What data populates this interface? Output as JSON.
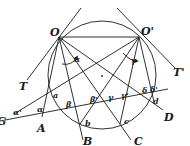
{
  "figure": {
    "colors": {
      "ink": "#1a1a1a",
      "background": "#ffffff"
    },
    "points": {
      "O": {
        "label": "O",
        "x": 59,
        "y": 37
      },
      "O_prime": {
        "label": "O'",
        "x": 139,
        "y": 37
      },
      "a": {
        "label": "a",
        "x": 50,
        "y": 94
      },
      "b": {
        "label": "b",
        "x": 80,
        "y": 124
      },
      "c": {
        "label": "c",
        "x": 120,
        "y": 124
      },
      "d": {
        "label": "d",
        "x": 154,
        "y": 102
      }
    },
    "circle": {
      "cx": 102,
      "cy": 75,
      "r": 54
    },
    "labels": {
      "T": "T",
      "T_prime": "T'",
      "A": "A",
      "B": "B",
      "C": "C",
      "D": "D",
      "G": "G",
      "a": "a",
      "b": "b",
      "c": "c",
      "d": "d",
      "O": "O",
      "O_prime": "O'",
      "alpha": "α",
      "alpha_prime": "α'",
      "beta": "β",
      "beta_prime": "β'",
      "beta_prime_2": "β'",
      "gamma": "γ",
      "gamma_prime": "γ'",
      "delta": "δ",
      "delta_prime": "δ'",
      "alpha_upper": "α"
    }
  }
}
